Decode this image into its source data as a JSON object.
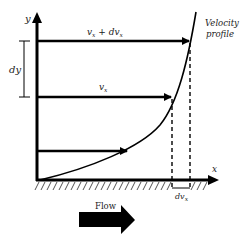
{
  "diagram": {
    "axes": {
      "x_label": "x",
      "y_label": "y"
    },
    "labels": {
      "profile_line1": "Velocity",
      "profile_line2": "profile",
      "top_arrow": "vx + dvx",
      "top_arrow_base": "v",
      "top_arrow_sub1": "x",
      "top_arrow_mid": " + dv",
      "top_arrow_sub2": "x",
      "mid_arrow_base": "v",
      "mid_arrow_sub": "x",
      "dy": "dy",
      "dvx_base": "dv",
      "dvx_sub": "x",
      "flow": "Flow"
    },
    "colors": {
      "stroke": "#000000",
      "text": "#222222",
      "background": "#ffffff"
    }
  }
}
